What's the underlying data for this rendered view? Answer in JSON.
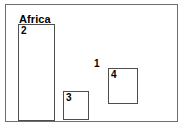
{
  "diagram": {
    "title": "Africa",
    "outer_region": {
      "label": "1",
      "name": "outer-region"
    },
    "regions": [
      {
        "label": "2",
        "name": "region-2"
      },
      {
        "label": "3",
        "name": "region-3"
      },
      {
        "label": "4",
        "name": "region-4"
      }
    ]
  },
  "colors": {
    "background": "#ffffff",
    "outer_border": "#6e6e6e",
    "box_border": "#4d4d4d",
    "text": "#000000"
  }
}
